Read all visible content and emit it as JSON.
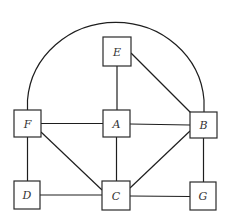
{
  "diagram": {
    "type": "graph",
    "nodes": [
      {
        "id": "E",
        "label": "E",
        "x": 103,
        "y": 37,
        "w": 28,
        "h": 29
      },
      {
        "id": "F",
        "label": "F",
        "x": 14,
        "y": 110,
        "w": 27,
        "h": 27
      },
      {
        "id": "A",
        "label": "A",
        "x": 103,
        "y": 110,
        "w": 27,
        "h": 27
      },
      {
        "id": "B",
        "label": "B",
        "x": 190,
        "y": 112,
        "w": 27,
        "h": 26
      },
      {
        "id": "D",
        "label": "D",
        "x": 14,
        "y": 181,
        "w": 26,
        "h": 28
      },
      {
        "id": "C",
        "label": "C",
        "x": 102,
        "y": 181,
        "w": 28,
        "h": 29
      },
      {
        "id": "G",
        "label": "G",
        "x": 190,
        "y": 182,
        "w": 26,
        "h": 28
      }
    ],
    "edges": [
      {
        "from": "E",
        "to": "A"
      },
      {
        "from": "E",
        "to": "B"
      },
      {
        "from": "F",
        "to": "A"
      },
      {
        "from": "A",
        "to": "B"
      },
      {
        "from": "F",
        "to": "C"
      },
      {
        "from": "A",
        "to": "C"
      },
      {
        "from": "B",
        "to": "C"
      },
      {
        "from": "F",
        "to": "D"
      },
      {
        "from": "D",
        "to": "C"
      },
      {
        "from": "C",
        "to": "G"
      },
      {
        "from": "B",
        "to": "G"
      },
      {
        "from": "F",
        "to": "B",
        "style": "arc"
      }
    ],
    "colors": {
      "stroke": "#1e1e1e",
      "background": "#ffffff",
      "label": "#333333"
    }
  }
}
